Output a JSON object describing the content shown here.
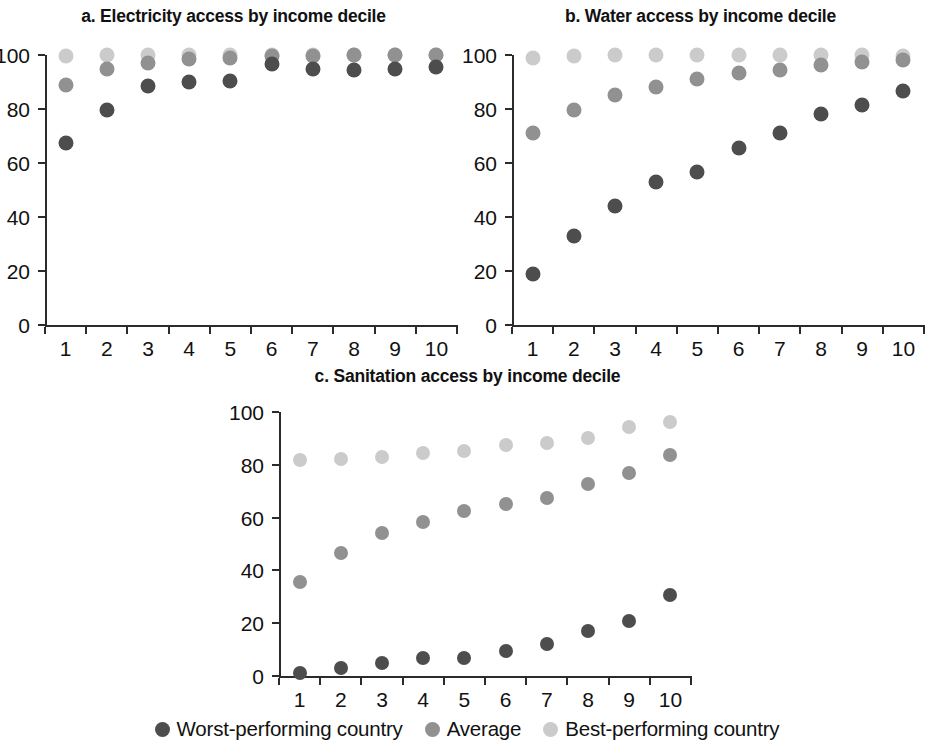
{
  "figure": {
    "background": "#ffffff",
    "panels": [
      "a",
      "b",
      "c"
    ]
  },
  "legend": {
    "items": [
      {
        "label": "Worst-performing country",
        "color": "#4d4d4d",
        "key": "worst"
      },
      {
        "label": "Average",
        "color": "#919191",
        "key": "average"
      },
      {
        "label": "Best-performing country",
        "color": "#cbcbcb",
        "key": "best"
      }
    ]
  },
  "chart_data": [
    {
      "id": "panel-a",
      "type": "scatter",
      "title": "a. Electricity access by income decile",
      "xlabel": "",
      "ylabel": "",
      "categories": [
        "1",
        "2",
        "3",
        "4",
        "5",
        "6",
        "7",
        "8",
        "9",
        "10"
      ],
      "x": [
        1,
        2,
        3,
        4,
        5,
        6,
        7,
        8,
        9,
        10
      ],
      "xlim": [
        0.5,
        10.5
      ],
      "ylim": [
        0,
        100
      ],
      "yticks": [
        0,
        20,
        40,
        60,
        80,
        100
      ],
      "grid": false,
      "legend_position": "bottom",
      "series": [
        {
          "name": "Worst-performing country",
          "color": "#4d4d4d",
          "values": [
            67.5,
            79.5,
            88.5,
            90,
            90.5,
            96.5,
            95,
            94.5,
            95,
            95.5
          ]
        },
        {
          "name": "Average",
          "color": "#919191",
          "values": [
            89,
            95,
            97,
            98.5,
            99,
            99.5,
            99.5,
            100,
            100,
            100
          ]
        },
        {
          "name": "Best-performing country",
          "color": "#cbcbcb",
          "values": [
            99.5,
            100,
            100,
            100,
            100,
            100,
            100,
            100,
            100,
            100
          ]
        }
      ]
    },
    {
      "id": "panel-b",
      "type": "scatter",
      "title": "b. Water access by income decile",
      "xlabel": "",
      "ylabel": "",
      "categories": [
        "1",
        "2",
        "3",
        "4",
        "5",
        "6",
        "7",
        "8",
        "9",
        "10"
      ],
      "x": [
        1,
        2,
        3,
        4,
        5,
        6,
        7,
        8,
        9,
        10
      ],
      "xlim": [
        0.5,
        10.5
      ],
      "ylim": [
        0,
        100
      ],
      "yticks": [
        0,
        20,
        40,
        60,
        80,
        100
      ],
      "grid": false,
      "legend_position": "bottom",
      "series": [
        {
          "name": "Worst-performing country",
          "color": "#4d4d4d",
          "values": [
            18.8,
            33,
            44,
            53,
            56.8,
            65.5,
            71.2,
            78.3,
            81.3,
            86.8
          ]
        },
        {
          "name": "Average",
          "color": "#919191",
          "values": [
            71,
            79.8,
            85.3,
            88.3,
            91,
            93.5,
            94.3,
            96.3,
            97.3,
            98.3
          ]
        },
        {
          "name": "Best-performing country",
          "color": "#cbcbcb",
          "values": [
            99,
            99.8,
            100,
            100,
            100,
            100,
            100,
            100,
            100,
            99.8
          ]
        }
      ]
    },
    {
      "id": "panel-c",
      "type": "scatter",
      "title": "c. Sanitation access by income decile",
      "xlabel": "",
      "ylabel": "",
      "categories": [
        "1",
        "2",
        "3",
        "4",
        "5",
        "6",
        "7",
        "8",
        "9",
        "10"
      ],
      "x": [
        1,
        2,
        3,
        4,
        5,
        6,
        7,
        8,
        9,
        10
      ],
      "xlim": [
        0.5,
        10.5
      ],
      "ylim": [
        0,
        100
      ],
      "yticks": [
        0,
        20,
        40,
        60,
        80,
        100
      ],
      "grid": false,
      "legend_position": "bottom",
      "series": [
        {
          "name": "Worst-performing country",
          "color": "#4d4d4d",
          "values": [
            1.3,
            3,
            4.8,
            6.8,
            7,
            9.3,
            12.3,
            17,
            20.8,
            30.8
          ]
        },
        {
          "name": "Average",
          "color": "#919191",
          "values": [
            35.5,
            46.5,
            54.3,
            58.5,
            62.5,
            65.3,
            67.5,
            72.8,
            76.8,
            83.8
          ]
        },
        {
          "name": "Best-performing country",
          "color": "#cbcbcb",
          "values": [
            81.8,
            82.3,
            82.8,
            84.3,
            85.3,
            87.5,
            88.3,
            90,
            94.5,
            96.3
          ]
        }
      ]
    }
  ]
}
